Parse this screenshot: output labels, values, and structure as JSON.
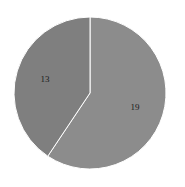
{
  "chart_data": {
    "type": "pie",
    "title": "",
    "slices": [
      {
        "label": "19",
        "value": 19,
        "color": "#8c8c8c"
      },
      {
        "label": "13",
        "value": 13,
        "color": "#7f7f7f"
      }
    ],
    "start_angle_deg": 0,
    "direction": "clockwise",
    "legend": "none",
    "separator_color": "#ffffff"
  }
}
